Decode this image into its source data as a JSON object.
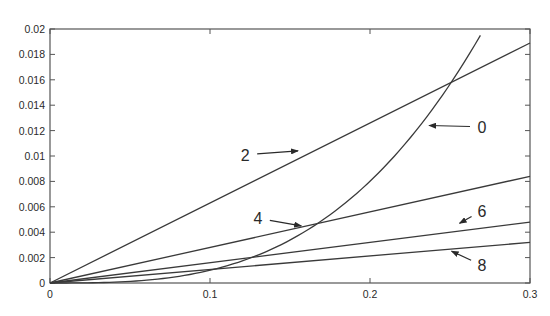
{
  "chart_data": {
    "type": "line",
    "title": "",
    "xlabel": "",
    "ylabel": "",
    "xlim": [
      0,
      0.3
    ],
    "ylim": [
      0,
      0.02
    ],
    "grid": false,
    "legend": "none (inline arrow annotations)",
    "x_ticks": [
      "0",
      "0.1",
      "0.2",
      "0.3"
    ],
    "x_tick_values": [
      0,
      0.1,
      0.2,
      0.3
    ],
    "y_ticks": [
      "0",
      "0.002",
      "0.004",
      "0.006",
      "0.008",
      "0.01",
      "0.012",
      "0.014",
      "0.016",
      "0.018",
      "0.02"
    ],
    "y_tick_values": [
      0,
      0.002,
      0.004,
      0.006,
      0.008,
      0.01,
      0.012,
      0.014,
      0.016,
      0.018,
      0.02
    ],
    "series": [
      {
        "name": "0",
        "kind": "curve",
        "x": [
          0,
          0.05,
          0.1,
          0.15,
          0.2,
          0.25,
          0.269
        ],
        "values": [
          0,
          0.000125,
          0.001,
          0.0034,
          0.008,
          0.0156,
          0.0195
        ]
      },
      {
        "name": "2",
        "kind": "line",
        "x": [
          0,
          0.3
        ],
        "values": [
          0,
          0.0189
        ]
      },
      {
        "name": "4",
        "kind": "line",
        "x": [
          0,
          0.3
        ],
        "values": [
          0,
          0.0084
        ]
      },
      {
        "name": "6",
        "kind": "line",
        "x": [
          0,
          0.3
        ],
        "values": [
          0,
          0.0048
        ]
      },
      {
        "name": "8",
        "kind": "line",
        "x": [
          0,
          0.3
        ],
        "values": [
          0,
          0.0032
        ]
      }
    ],
    "annotations": [
      {
        "label": "0",
        "text_x": 0.27,
        "text_y": 0.0123,
        "arrow_to_x": 0.237,
        "arrow_to_y": 0.0124
      },
      {
        "label": "2",
        "text_x": 0.122,
        "text_y": 0.0101,
        "arrow_to_x": 0.155,
        "arrow_to_y": 0.0104
      },
      {
        "label": "4",
        "text_x": 0.13,
        "text_y": 0.0051,
        "arrow_to_x": 0.157,
        "arrow_to_y": 0.0045
      },
      {
        "label": "6",
        "text_x": 0.27,
        "text_y": 0.0057,
        "arrow_to_x": 0.256,
        "arrow_to_y": 0.0047
      },
      {
        "label": "8",
        "text_x": 0.27,
        "text_y": 0.0014,
        "arrow_to_x": 0.251,
        "arrow_to_y": 0.0025
      }
    ],
    "colors": {
      "line": "#3a3a3a",
      "axis": "#555555",
      "text": "#2a2a2a",
      "background": "#ffffff"
    }
  }
}
